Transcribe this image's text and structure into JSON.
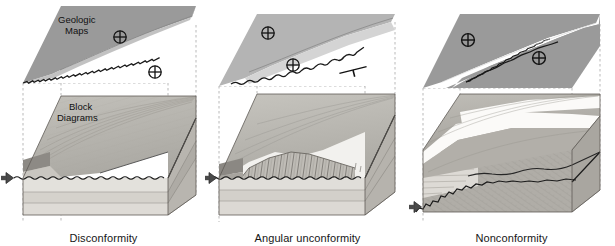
{
  "figure": {
    "background": "#ffffff",
    "width": 615,
    "height": 246,
    "row_labels": {
      "top_row": "Geologic Maps",
      "bottom_row": "Block Diagrams"
    },
    "colors": {
      "map_fill_dark": "#9a9a9a",
      "map_fill_mid": "#b4b4b4",
      "map_fill_light": "#d9d9d9",
      "map_fill_white": "#ffffff",
      "block_top_surface": "#b9b7b2",
      "block_front_light": "#dcdad5",
      "block_front_mid": "#c6c3bd",
      "block_side_dark": "#a9a6a0",
      "contact_line": "#1a1a1a",
      "guide_line": "#9b9b9b",
      "arrow_marker": "#3a3a3a",
      "text": "#161616"
    }
  },
  "panels": [
    {
      "id": "panel-1",
      "caption": "Disconformity",
      "map": {
        "name": "geologic-map-disconformity",
        "label": "Geologic Maps",
        "label_lines": [
          "Geologic",
          "Maps"
        ],
        "contact_style": "wavy-serrated",
        "units": [
          {
            "name": "upper-unit",
            "fill": "#9a9a9a"
          },
          {
            "name": "lower-unit",
            "fill": "#ffffff"
          }
        ],
        "symbols": [
          {
            "name": "horizontal-bedding-symbol",
            "glyph": "crossed-circle",
            "x": 120,
            "y": 37
          },
          {
            "name": "horizontal-bedding-symbol",
            "glyph": "crossed-circle",
            "x": 155,
            "y": 72
          }
        ]
      },
      "block": {
        "name": "block-diagram-disconformity",
        "label": "Block Diagrams",
        "label_lines": [
          "Block",
          "Diagrams"
        ],
        "unconformity_type": "disconformity",
        "beds_below": "horizontal-parallel",
        "beds_above": "horizontal-parallel",
        "arrow_marker": {
          "name": "unconformity-arrow-marker",
          "direction": "right",
          "x": 6,
          "y": 178
        }
      }
    },
    {
      "id": "panel-2",
      "caption": "Angular unconformity",
      "map": {
        "name": "geologic-map-angular-unconformity",
        "label": "Geologic Maps",
        "contact_style": "wavy-serrated",
        "units": [
          {
            "name": "upper-unit",
            "fill": "#b4b4b4"
          },
          {
            "name": "truncated-unit",
            "fill": "#d9d9d9"
          },
          {
            "name": "lower-unit",
            "fill": "#ffffff"
          }
        ],
        "symbols": [
          {
            "name": "horizontal-bedding-symbol",
            "glyph": "crossed-circle",
            "x": 63,
            "y": 33
          },
          {
            "name": "horizontal-bedding-symbol",
            "glyph": "crossed-circle",
            "x": 88,
            "y": 65
          },
          {
            "name": "strike-and-dip-symbol",
            "glyph": "strike-dip-tick",
            "x": 148,
            "y": 70
          }
        ]
      },
      "block": {
        "name": "block-diagram-angular-unconformity",
        "label": "Block Diagrams",
        "unconformity_type": "angular-unconformity",
        "beds_below": "steeply-dipping-truncated",
        "beds_above": "horizontal-parallel",
        "arrow_marker": {
          "name": "unconformity-arrow-marker",
          "direction": "right",
          "x": 4,
          "y": 178
        }
      }
    },
    {
      "id": "panel-3",
      "caption": "Nonconformity",
      "map": {
        "name": "geologic-map-nonconformity",
        "label": "Geologic Maps",
        "contact_style": "wavy-irregular",
        "units": [
          {
            "name": "sedimentary-unit",
            "fill": "#9a9a9a"
          },
          {
            "name": "sandstone-band",
            "fill": "#ffffff"
          },
          {
            "name": "basement-unit",
            "fill": "#9a9a9a"
          }
        ],
        "symbols": [
          {
            "name": "horizontal-bedding-symbol",
            "glyph": "crossed-circle",
            "x": 60,
            "y": 40
          },
          {
            "name": "horizontal-bedding-symbol",
            "glyph": "crossed-circle",
            "x": 131,
            "y": 58
          }
        ]
      },
      "block": {
        "name": "block-diagram-nonconformity",
        "label": "Block Diagrams",
        "unconformity_type": "nonconformity",
        "beds_below": "crystalline-basement",
        "beds_above": "horizontal-sedimentary",
        "arrow_marker": {
          "name": "unconformity-arrow-marker",
          "direction": "right",
          "x": 6,
          "y": 207
        }
      }
    }
  ]
}
